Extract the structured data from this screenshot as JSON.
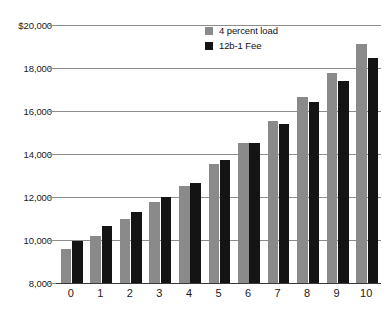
{
  "title_remnant": "",
  "legend": {
    "position": "top-center-right",
    "items": [
      {
        "label": "4 percent load",
        "color": "#8a8a8a",
        "swatch": "gray-swatch-icon"
      },
      {
        "label": "12b-1 Fee",
        "color": "#141414",
        "swatch": "black-swatch-icon"
      }
    ]
  },
  "axes": {
    "y_ticks": [
      "$20,000",
      "18,000",
      "16,000",
      "14,000",
      "12,000",
      "10,000",
      "8,000"
    ],
    "x_ticks": [
      "0",
      "1",
      "2",
      "3",
      "4",
      "5",
      "6",
      "7",
      "8",
      "9",
      "10"
    ]
  },
  "colors": {
    "series_gray": "#8a8a8a",
    "series_black": "#141414",
    "gridline": "#8d8d8d",
    "axis": "#3a3a3a",
    "background": "#ffffff",
    "text": "#1a1a1a"
  },
  "chart_data": {
    "type": "bar",
    "title": "",
    "xlabel": "",
    "ylabel": "",
    "grid": true,
    "legend_position": "top-right",
    "categories": [
      "0",
      "1",
      "2",
      "3",
      "4",
      "5",
      "6",
      "7",
      "8",
      "9",
      "10"
    ],
    "ylim": [
      8000,
      20000
    ],
    "ytick_values": [
      8000,
      10000,
      12000,
      14000,
      16000,
      18000,
      20000
    ],
    "ytick_labels": [
      "8,000",
      "10,000",
      "12,000",
      "14,000",
      "16,000",
      "18,000",
      "$20,000"
    ],
    "series": [
      {
        "name": "4 percent load",
        "color": "#8a8a8a",
        "values": [
          9600,
          10200,
          11000,
          11750,
          12500,
          13550,
          14500,
          15550,
          16650,
          17750,
          19100
        ]
      },
      {
        "name": "12b-1 Fee",
        "color": "#141414",
        "values": [
          9950,
          10650,
          11300,
          12000,
          12650,
          13700,
          14500,
          15400,
          16400,
          17400,
          18450
        ]
      }
    ]
  }
}
